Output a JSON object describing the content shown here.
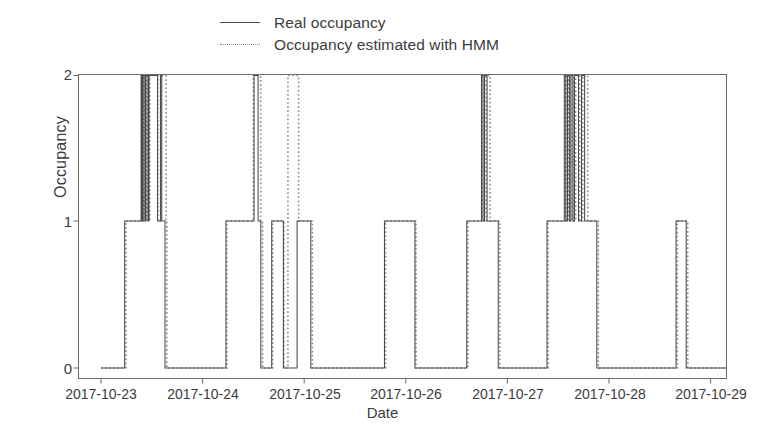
{
  "chart_data": {
    "type": "line",
    "title": "",
    "xlabel": "Date",
    "ylabel": "Occupancy",
    "ylim": [
      0,
      2
    ],
    "yticks": [
      0,
      1,
      2
    ],
    "ytick_labels": [
      "0",
      "1",
      "2"
    ],
    "xtick_labels": [
      "2017-10-23",
      "2017-10-24",
      "2017-10-25",
      "2017-10-26",
      "2017-10-27",
      "2017-10-28",
      "2017-10-29"
    ],
    "xlim": [
      "2017-10-22 18:30",
      "2017-10-29 03:30"
    ],
    "grid": false,
    "legend_position": "above-plot-center",
    "drawstyle": "steps-post",
    "series": [
      {
        "name": "Real occupancy",
        "style": "solid",
        "color": "#4a4a4a",
        "steps": [
          {
            "x": 0.0,
            "y": 0
          },
          {
            "x": 0.233,
            "y": 1
          },
          {
            "x": 0.395,
            "y": 2
          },
          {
            "x": 0.405,
            "y": 1
          },
          {
            "x": 0.415,
            "y": 2
          },
          {
            "x": 0.432,
            "y": 1
          },
          {
            "x": 0.442,
            "y": 2
          },
          {
            "x": 0.462,
            "y": 1
          },
          {
            "x": 0.472,
            "y": 2
          },
          {
            "x": 0.556,
            "y": 1
          },
          {
            "x": 0.585,
            "y": 2
          },
          {
            "x": 0.598,
            "y": 1
          },
          {
            "x": 0.63,
            "y": 0
          },
          {
            "x": 1.23,
            "y": 1
          },
          {
            "x": 1.506,
            "y": 2
          },
          {
            "x": 1.546,
            "y": 1
          },
          {
            "x": 1.573,
            "y": 0
          },
          {
            "x": 1.68,
            "y": 1
          },
          {
            "x": 1.795,
            "y": 0
          },
          {
            "x": 1.93,
            "y": 1
          },
          {
            "x": 2.065,
            "y": 0
          },
          {
            "x": 2.79,
            "y": 1
          },
          {
            "x": 3.09,
            "y": 0
          },
          {
            "x": 3.6,
            "y": 1
          },
          {
            "x": 3.745,
            "y": 2
          },
          {
            "x": 3.76,
            "y": 1
          },
          {
            "x": 3.775,
            "y": 2
          },
          {
            "x": 3.8,
            "y": 1
          },
          {
            "x": 3.91,
            "y": 0
          },
          {
            "x": 4.39,
            "y": 1
          },
          {
            "x": 4.56,
            "y": 2
          },
          {
            "x": 4.575,
            "y": 1
          },
          {
            "x": 4.592,
            "y": 2
          },
          {
            "x": 4.61,
            "y": 1
          },
          {
            "x": 4.625,
            "y": 2
          },
          {
            "x": 4.645,
            "y": 1
          },
          {
            "x": 4.66,
            "y": 2
          },
          {
            "x": 4.7,
            "y": 1
          },
          {
            "x": 4.73,
            "y": 2
          },
          {
            "x": 4.76,
            "y": 1
          },
          {
            "x": 4.88,
            "y": 0
          },
          {
            "x": 5.66,
            "y": 1
          },
          {
            "x": 5.76,
            "y": 0
          },
          {
            "x": 6.2,
            "y": 0
          }
        ]
      },
      {
        "name": "Occupancy estimated with HMM",
        "style": "dotted",
        "color": "#8d8d8d",
        "steps": [
          {
            "x": 0.0,
            "y": 0
          },
          {
            "x": 0.245,
            "y": 1
          },
          {
            "x": 0.4,
            "y": 2
          },
          {
            "x": 0.412,
            "y": 1
          },
          {
            "x": 0.422,
            "y": 2
          },
          {
            "x": 0.438,
            "y": 1
          },
          {
            "x": 0.45,
            "y": 2
          },
          {
            "x": 0.47,
            "y": 1
          },
          {
            "x": 0.48,
            "y": 2
          },
          {
            "x": 0.56,
            "y": 1
          },
          {
            "x": 0.592,
            "y": 2
          },
          {
            "x": 0.64,
            "y": 1
          },
          {
            "x": 0.648,
            "y": 0
          },
          {
            "x": 1.238,
            "y": 1
          },
          {
            "x": 1.5,
            "y": 2
          },
          {
            "x": 1.572,
            "y": 1
          },
          {
            "x": 1.59,
            "y": 0
          },
          {
            "x": 1.69,
            "y": 1
          },
          {
            "x": 1.8,
            "y": 0
          },
          {
            "x": 1.84,
            "y": 2
          },
          {
            "x": 1.945,
            "y": 1
          },
          {
            "x": 2.08,
            "y": 0
          },
          {
            "x": 2.8,
            "y": 1
          },
          {
            "x": 3.1,
            "y": 0
          },
          {
            "x": 3.61,
            "y": 1
          },
          {
            "x": 3.75,
            "y": 2
          },
          {
            "x": 3.77,
            "y": 1
          },
          {
            "x": 3.79,
            "y": 2
          },
          {
            "x": 3.83,
            "y": 1
          },
          {
            "x": 3.925,
            "y": 0
          },
          {
            "x": 4.4,
            "y": 1
          },
          {
            "x": 4.57,
            "y": 2
          },
          {
            "x": 4.585,
            "y": 1
          },
          {
            "x": 4.6,
            "y": 2
          },
          {
            "x": 4.62,
            "y": 1
          },
          {
            "x": 4.636,
            "y": 2
          },
          {
            "x": 4.655,
            "y": 1
          },
          {
            "x": 4.672,
            "y": 2
          },
          {
            "x": 4.712,
            "y": 1
          },
          {
            "x": 4.742,
            "y": 2
          },
          {
            "x": 4.79,
            "y": 1
          },
          {
            "x": 4.895,
            "y": 0
          },
          {
            "x": 5.672,
            "y": 1
          },
          {
            "x": 5.775,
            "y": 0
          },
          {
            "x": 6.2,
            "y": 0
          }
        ]
      }
    ]
  },
  "legend": {
    "items": [
      {
        "label": "Real occupancy",
        "style": "solid"
      },
      {
        "label": "Occupancy estimated with HMM",
        "style": "dashed"
      }
    ]
  },
  "axes": {
    "ylabel": "Occupancy",
    "xlabel": "Date",
    "ytick_labels": [
      "2",
      "1",
      "0"
    ],
    "xtick_labels": [
      "2017-10-23",
      "2017-10-24",
      "2017-10-25",
      "2017-10-26",
      "2017-10-27",
      "2017-10-28",
      "2017-10-29"
    ]
  },
  "colors": {
    "real": "#4a4a4a",
    "hmm": "#8d8d8d",
    "axis": "#6b6b6b",
    "background": "#ffffff"
  }
}
